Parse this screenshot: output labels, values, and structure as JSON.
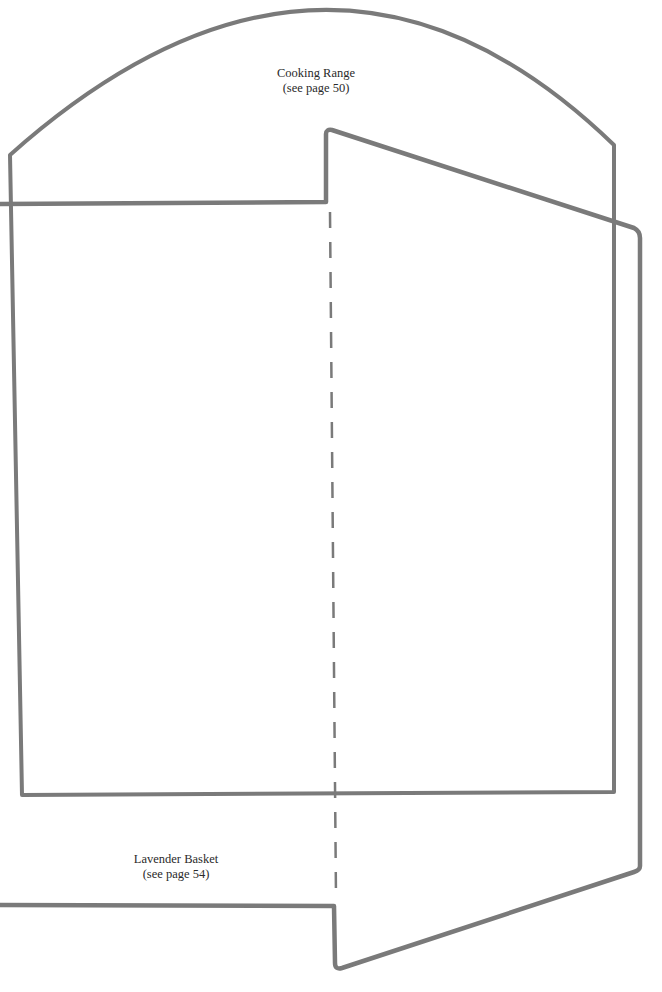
{
  "colors": {
    "stroke": "#7a7a7a",
    "text": "#2a2a2a",
    "background": "#ffffff"
  },
  "templates": [
    {
      "id": "cooking-range",
      "title": "Cooking Range",
      "reference": "(see page 50)"
    },
    {
      "id": "lavender-basket",
      "title": "Lavender Basket",
      "reference": "(see page 54)"
    }
  ],
  "fold_line": {
    "style": "dashed"
  }
}
